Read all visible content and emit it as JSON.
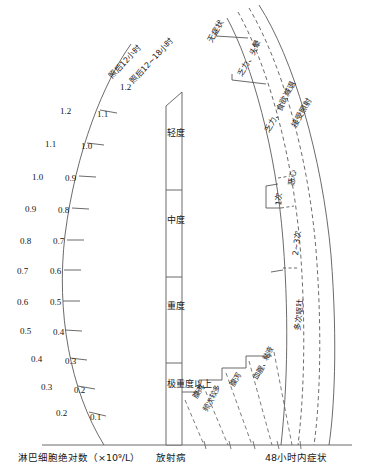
{
  "figure": {
    "type": "nomogram"
  },
  "left_axis": {
    "caption": "淋巴细胞绝对数（×10⁹/L）",
    "series_labels": [
      {
        "id": "s1",
        "text": "照后12小时"
      },
      {
        "id": "s2",
        "text": "照后12~18小时"
      }
    ],
    "ticks": [
      {
        "left": "",
        "right": "1.2"
      },
      {
        "left": "1.2",
        "right": "1.1"
      },
      {
        "left": "1.1",
        "right": "1.0"
      },
      {
        "left": "1.0",
        "right": "0.9"
      },
      {
        "left": "0.9",
        "right": "0.8"
      },
      {
        "left": "0.8",
        "right": "0.7"
      },
      {
        "left": "0.7",
        "right": "0.6"
      },
      {
        "left": "0.6",
        "right": "0.5"
      },
      {
        "left": "0.5",
        "right": "0.4"
      },
      {
        "left": "0.4",
        "right": "0.3"
      },
      {
        "left": "0.3",
        "right": "0.2"
      },
      {
        "left": "0.2",
        "right": "0.1"
      }
    ]
  },
  "center_axis": {
    "caption": "放射病",
    "bands": [
      {
        "id": "mild",
        "text": "轻度"
      },
      {
        "id": "moderate",
        "text": "中度"
      },
      {
        "id": "severe",
        "text": "重度"
      },
      {
        "id": "extreme",
        "text": "极重度以上"
      }
    ]
  },
  "right_axis": {
    "caption": "48小时内症状",
    "arc_labels": [
      {
        "id": "a1",
        "text": "无症状"
      },
      {
        "id": "a2",
        "text": "乏力、头晕"
      },
      {
        "id": "a3",
        "text": "乏力、食欲减退"
      },
      {
        "id": "a4",
        "text": "接受照射"
      }
    ],
    "nausea_labels": [
      {
        "id": "n0",
        "text": "恶心"
      },
      {
        "id": "n1",
        "text": "1次"
      },
      {
        "id": "n2",
        "text": "2~3次"
      },
      {
        "id": "n3",
        "text": "多次呕吐"
      }
    ],
    "step_labels": [
      {
        "id": "t1",
        "text": "腹泻"
      },
      {
        "id": "t2",
        "text": "频次较多"
      },
      {
        "id": "t3",
        "text": "腹泻"
      },
      {
        "id": "t4",
        "text": "血腥、粘液"
      }
    ]
  },
  "colors": {
    "line": "#555555",
    "text": "#161616",
    "background": "#ffffff"
  }
}
